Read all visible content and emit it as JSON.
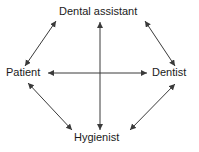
{
  "diagram": {
    "type": "relationship-network",
    "background_color": "#ffffff",
    "stroke_color": "#3a3a3a",
    "text_color": "#1a1a1a",
    "nodes": [
      {
        "id": "dental-assistant",
        "label": "Dental assistant",
        "position": "top"
      },
      {
        "id": "patient",
        "label": "Patient",
        "position": "left"
      },
      {
        "id": "dentist",
        "label": "Dentist",
        "position": "right"
      },
      {
        "id": "hygienist",
        "label": "Hygienist",
        "position": "bottom"
      }
    ],
    "edges": [
      {
        "id": "patient-dental-assistant",
        "from": "Patient",
        "to": "Dental assistant",
        "style": "double-headed-arrow"
      },
      {
        "id": "dental-assistant-dentist",
        "from": "Dental assistant",
        "to": "Dentist",
        "style": "double-headed-arrow"
      },
      {
        "id": "patient-dentist",
        "from": "Patient",
        "to": "Dentist",
        "style": "double-headed-arrow"
      },
      {
        "id": "dental-assistant-hygienist",
        "from": "Dental assistant",
        "to": "Hygienist",
        "style": "double-headed-arrow"
      },
      {
        "id": "patient-hygienist",
        "from": "Patient",
        "to": "Hygienist",
        "style": "double-headed-arrow"
      },
      {
        "id": "hygienist-dentist",
        "from": "Hygienist",
        "to": "Dentist",
        "style": "double-headed-arrow"
      }
    ]
  }
}
